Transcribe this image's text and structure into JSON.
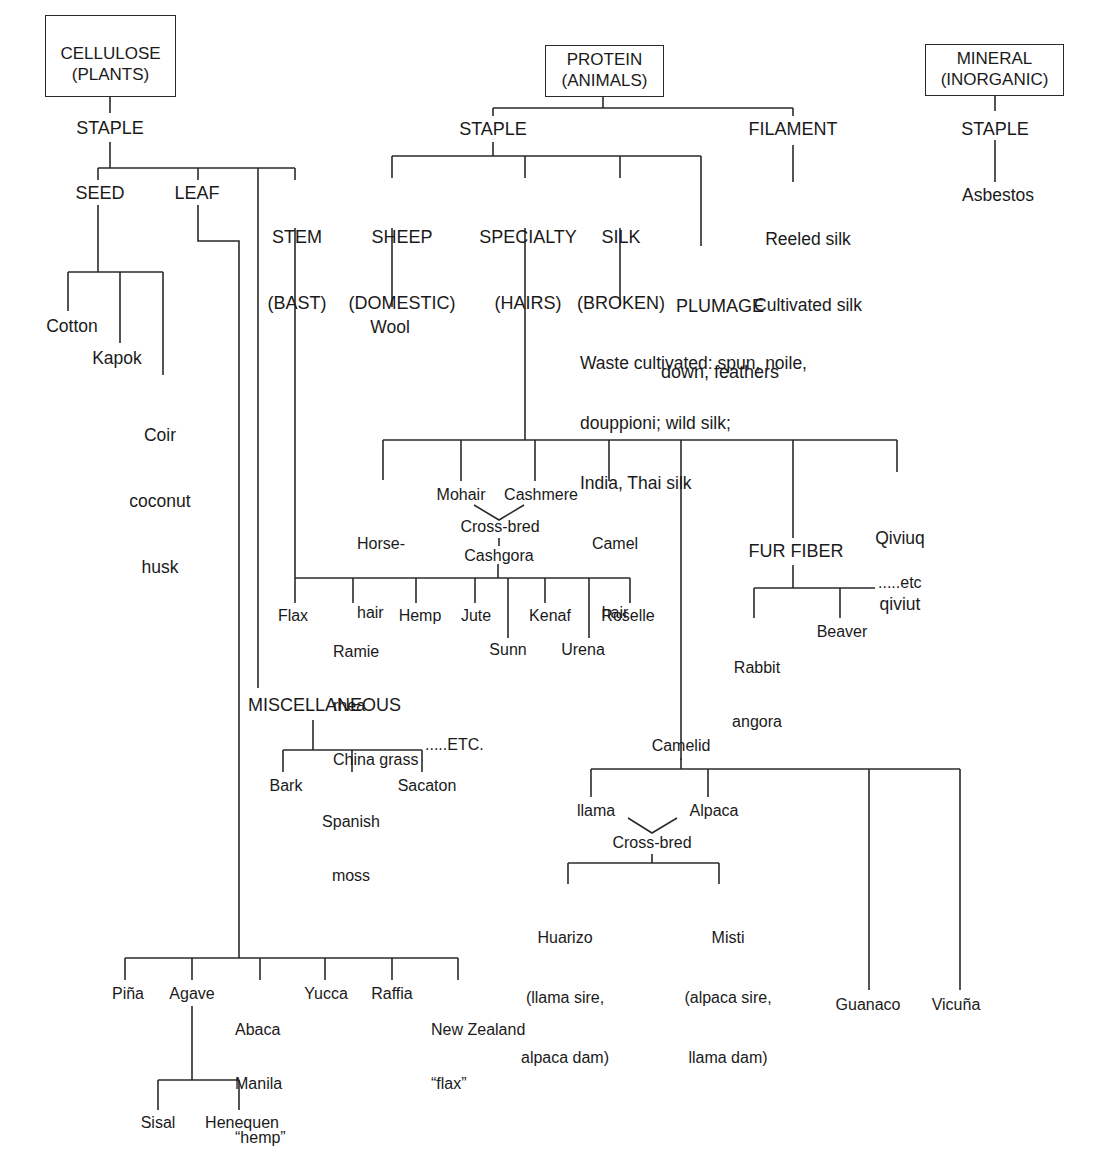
{
  "diagram": {
    "roots": {
      "cellulose": {
        "line1": "CELLULOSE",
        "line2": "(PLANTS)"
      },
      "protein": {
        "line1": "PROTEIN",
        "line2": "(ANIMALS)"
      },
      "mineral": {
        "line1": "MINERAL",
        "line2": "(INORGANIC)"
      }
    },
    "cellulose": {
      "staple": "STAPLE",
      "seed": {
        "label": "SEED",
        "items": [
          {
            "lines": [
              "Cotton"
            ]
          },
          {
            "lines": [
              "Kapok"
            ]
          },
          {
            "lines": [
              "Coir",
              "coconut",
              "husk"
            ]
          }
        ]
      },
      "leaf": {
        "label": "LEAF",
        "items": [
          {
            "lines": [
              "Piña"
            ]
          },
          {
            "lines": [
              "Agave"
            ]
          },
          {
            "lines": [
              "Abaca",
              "Manila",
              "“hemp”"
            ]
          },
          {
            "lines": [
              "Yucca"
            ]
          },
          {
            "lines": [
              "Raffia"
            ]
          },
          {
            "lines": [
              "New Zealand",
              "“flax”"
            ]
          }
        ],
        "agave_children": [
          {
            "lines": [
              "Sisal"
            ]
          },
          {
            "lines": [
              "Henequen"
            ]
          }
        ]
      },
      "stem": {
        "label_line1": "STEM",
        "label_line2": "(BAST)",
        "items": [
          {
            "lines": [
              "Flax"
            ]
          },
          {
            "lines": [
              "Ramie",
              "rhea",
              "China grass"
            ]
          },
          {
            "lines": [
              "Hemp"
            ]
          },
          {
            "lines": [
              "Jute"
            ]
          },
          {
            "lines": [
              "Sunn"
            ]
          },
          {
            "lines": [
              "Kenaf"
            ]
          },
          {
            "lines": [
              "Urena"
            ]
          },
          {
            "lines": [
              "Roselle"
            ]
          }
        ]
      },
      "miscellaneous": {
        "label": "MISCELLANEOUS",
        "items": [
          {
            "lines": [
              "Bark"
            ]
          },
          {
            "lines": [
              "Spanish",
              "moss"
            ]
          },
          {
            "lines": [
              "Sacaton"
            ]
          }
        ],
        "etc": ".....ETC."
      }
    },
    "protein": {
      "staple": {
        "label": "STAPLE",
        "sheep": {
          "line1": "SHEEP",
          "line2": "(DOMESTIC)",
          "child": "Wool"
        },
        "specialty": {
          "line1": "SPECIALTY",
          "line2": "(HAIRS)",
          "items": {
            "horsehair": [
              "Horse-",
              "hair"
            ],
            "mohair": "Mohair",
            "cashmere": "Cashmere",
            "camel_hair": [
              "Camel",
              "hair"
            ],
            "crossbred": "Cross-bred",
            "cashgora": "Cashgora",
            "qiviuq": [
              "Qiviuq",
              "qiviut"
            ]
          },
          "fur_fiber": {
            "label": "FUR FIBER",
            "items": [
              {
                "lines": [
                  "Rabbit",
                  "angora"
                ]
              },
              {
                "lines": [
                  "Beaver"
                ]
              }
            ],
            "etc": ".....etc"
          },
          "camelid": {
            "label": "Camelid",
            "llama": "llama",
            "alpaca": "Alpaca",
            "crossbred": "Cross-bred",
            "huarizo": [
              "Huarizo",
              "(llama sire,",
              "alpaca dam)"
            ],
            "misti": [
              "Misti",
              "(alpaca sire,",
              "llama dam)"
            ],
            "guanaco": "Guanaco",
            "vicuna": "Vicuña"
          }
        },
        "silk": {
          "line1": "SILK",
          "line2": "(BROKEN)",
          "child_lines": [
            "Waste cultivated: spun, noile,",
            "douppioni; wild silk;",
            "India, Thai silk"
          ]
        },
        "plumage": {
          "line1": "PLUMAGE",
          "line2": "down, feathers"
        }
      },
      "filament": {
        "label": "FILAMENT",
        "child_lines": [
          "Reeled silk",
          "Cultivated silk"
        ]
      }
    },
    "mineral": {
      "staple": "STAPLE",
      "child": "Asbestos"
    },
    "colors": {
      "line": "#2a2a2a",
      "text": "#1a1a1a",
      "background": "#ffffff"
    }
  }
}
